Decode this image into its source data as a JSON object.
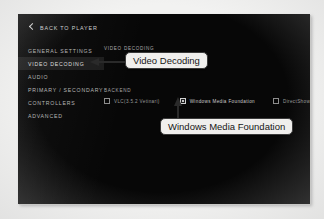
{
  "header": {
    "back_label": "BACK TO PLAYER",
    "back_icon": "chevron-left-icon"
  },
  "sidebar": {
    "items": [
      {
        "label": "GENERAL SETTINGS",
        "selected": false
      },
      {
        "label": "VIDEO DECODING",
        "selected": true
      },
      {
        "label": "AUDIO",
        "selected": false
      },
      {
        "label": "PRIMARY / SECONDARY",
        "selected": false
      },
      {
        "label": "CONTROLLERS",
        "selected": false
      },
      {
        "label": "ADVANCED",
        "selected": false
      }
    ]
  },
  "main": {
    "video_decoding_label": "VIDEO DECODING",
    "backend_label": "BACKEND",
    "backend_options": [
      {
        "label": "VLC(3.5.2 Vetinari)",
        "checked": false
      },
      {
        "label": "Windows Media Foundation",
        "checked": true
      },
      {
        "label": "DirectShow",
        "checked": false
      }
    ]
  },
  "annotations": {
    "callout_video_decoding": "Video Decoding",
    "callout_windows_media_foundation": "Windows Media Foundation",
    "arrow_left_icon": "arrow-left-icon",
    "arrow_up_icon": "arrow-up-icon"
  },
  "colors": {
    "panel_background": "#070707",
    "page_background": "#f2f2f1",
    "selected_item_background": "#1c1c1c",
    "callout_background": "#f0efed",
    "callout_border": "#3a3a3a",
    "checked_box": "#c6c6c6"
  }
}
